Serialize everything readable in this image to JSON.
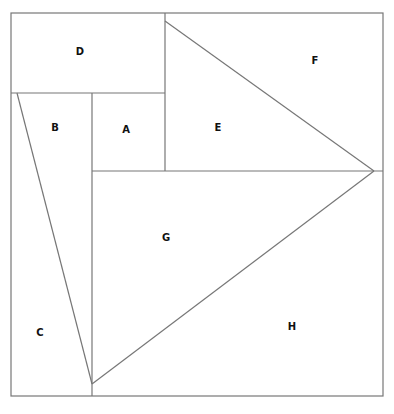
{
  "diagram": {
    "type": "tangram-like square dissection",
    "regions": [
      {
        "label": "A",
        "x": 126,
        "y": 130
      },
      {
        "label": "B",
        "x": 55,
        "y": 128
      },
      {
        "label": "C",
        "x": 40,
        "y": 333
      },
      {
        "label": "D",
        "x": 80,
        "y": 52
      },
      {
        "label": "E",
        "x": 218,
        "y": 128
      },
      {
        "label": "F",
        "x": 315,
        "y": 61
      },
      {
        "label": "G",
        "x": 166,
        "y": 238
      },
      {
        "label": "H",
        "x": 292,
        "y": 327
      }
    ],
    "line_color": "#777777",
    "label_color": "#111111"
  }
}
